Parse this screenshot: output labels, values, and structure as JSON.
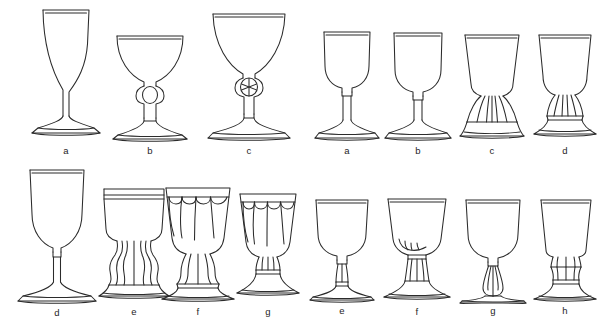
{
  "figure": {
    "background_color": "#ffffff",
    "line_color": "#2b2b2b",
    "rows": [
      {
        "row_index": 1,
        "items": [
          {
            "label": "a",
            "type": "tall-stem-wine-glass",
            "bowl": "flared-conical",
            "stem": "long-plain",
            "foot": "spreading-conical",
            "x": 24,
            "y": 4,
            "w": 84,
            "h": 157
          },
          {
            "label": "b",
            "type": "coupe-champagne-glass",
            "bowl": "shallow-hemispherical",
            "stem": "round-knop-plain",
            "foot": "spreading-conical",
            "x": 108,
            "y": 22,
            "w": 84,
            "h": 139
          },
          {
            "label": "c",
            "type": "knopped-goblet",
            "bowl": "deep-bucket-flared",
            "stem": "facet-cut-knop",
            "foot": "spreading-conical",
            "x": 204,
            "y": 8,
            "w": 90,
            "h": 153
          },
          {
            "label": "a",
            "type": "small-wine-glass",
            "bowl": "ogee-u-shaped",
            "stem": "short-plain",
            "foot": "spreading-conical",
            "x": 312,
            "y": 26,
            "w": 70,
            "h": 135
          },
          {
            "label": "b",
            "type": "small-wine-glass",
            "bowl": "deep-u-shaped",
            "stem": "short-plain",
            "foot": "spreading-conical",
            "x": 382,
            "y": 28,
            "w": 72,
            "h": 133
          },
          {
            "label": "c",
            "type": "rummer",
            "bowl": "straight-flared",
            "stem": "fluted-collar",
            "foot": "spreading-conical",
            "x": 456,
            "y": 30,
            "w": 72,
            "h": 131
          },
          {
            "label": "d",
            "type": "rummer",
            "bowl": "straight-flared",
            "stem": "fluted-ringed-collar",
            "foot": "spreading-conical",
            "x": 529,
            "y": 30,
            "w": 72,
            "h": 131
          }
        ]
      },
      {
        "row_index": 2,
        "items": [
          {
            "label": "d",
            "type": "tall-wine-goblet",
            "bowl": "large-ogee",
            "stem": "long-plain-collar",
            "foot": "spreading-conical",
            "x": 14,
            "y": 164,
            "w": 86,
            "h": 159
          },
          {
            "label": "e",
            "type": "ornate-hourglass-stem-goblet",
            "bowl": "banded-cylindrical",
            "stem": "waisted-hourglass-moulded",
            "foot": "spreading-conical",
            "x": 96,
            "y": 185,
            "w": 76,
            "h": 138
          },
          {
            "label": "f",
            "type": "petal-cut-goblet",
            "bowl": "flared-petal-panelled",
            "stem": "baluster-ringed",
            "foot": "spreading-conical",
            "x": 158,
            "y": 184,
            "w": 80,
            "h": 139
          },
          {
            "label": "g",
            "type": "petal-cut-goblet",
            "bowl": "flared-petal-panelled",
            "stem": "short-baluster-ringed",
            "foot": "spreading-conical",
            "x": 229,
            "y": 190,
            "w": 78,
            "h": 133
          },
          {
            "label": "e",
            "type": "small-wine-glass",
            "bowl": "deep-u-shaped",
            "stem": "plain-collar",
            "foot": "spreading-conical",
            "x": 306,
            "y": 196,
            "w": 72,
            "h": 127
          },
          {
            "label": "f",
            "type": "fluted-stem-glass",
            "bowl": "deep-u-shaped",
            "stem": "fluted-collar-ringed",
            "foot": "spreading-conical",
            "x": 379,
            "y": 195,
            "w": 76,
            "h": 128
          },
          {
            "label": "g",
            "type": "baluster-stem-glass",
            "bowl": "deep-u-shaped",
            "stem": "inverted-baluster",
            "foot": "spreading-conical",
            "x": 456,
            "y": 196,
            "w": 74,
            "h": 127
          },
          {
            "label": "h",
            "type": "dram-glass",
            "bowl": "straight-tapered",
            "stem": "short-knopped",
            "foot": "spreading-conical",
            "x": 529,
            "y": 196,
            "w": 72,
            "h": 127
          }
        ]
      }
    ]
  }
}
